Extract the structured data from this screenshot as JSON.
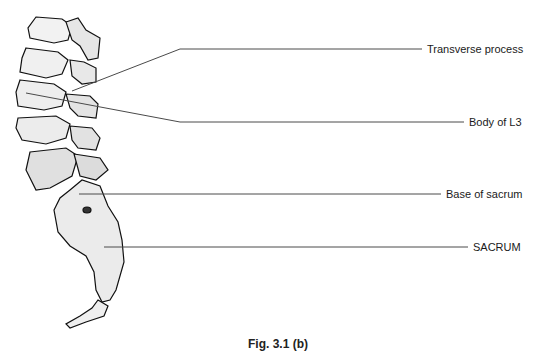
{
  "figure": {
    "caption": "Fig. 3.1 (b)",
    "illustration": "lateral view of lumbar spine and sacrum",
    "labels": [
      {
        "id": "transverse-process",
        "text": "Transverse process",
        "x": 427,
        "y": 19
      },
      {
        "id": "body-of-l3",
        "text": "Body of L3",
        "x": 469,
        "y": 116
      },
      {
        "id": "base-of-sacrum",
        "text": "Base of sacrum",
        "x": 446,
        "y": 188
      },
      {
        "id": "sacrum",
        "text": "SACRUM",
        "x": 473,
        "y": 241
      }
    ],
    "colors": {
      "line": "#4a4a4a",
      "text": "#1a1a1a",
      "background": "#ffffff"
    }
  }
}
